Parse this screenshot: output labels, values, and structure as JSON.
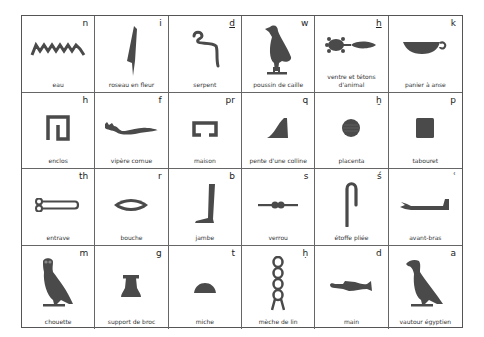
{
  "chart_title": "",
  "glyph_color": "#4a4a4a",
  "cells": [
    {
      "phoneme": "n",
      "underline": false,
      "label": "eau",
      "icon": "water-icon"
    },
    {
      "phoneme": "i",
      "underline": false,
      "label": "roseau en fleur",
      "icon": "reed-icon"
    },
    {
      "phoneme": "d",
      "underline": true,
      "label": "serpent",
      "icon": "cobra-icon"
    },
    {
      "phoneme": "w",
      "underline": false,
      "label": "poussin de caille",
      "icon": "quail-chick-icon"
    },
    {
      "phoneme": "h",
      "underline": true,
      "label": "ventre et tétons d'animal",
      "icon": "belly-icon"
    },
    {
      "phoneme": "k",
      "underline": false,
      "label": "panier à anse",
      "icon": "basket-icon"
    },
    {
      "phoneme": "h",
      "underline": false,
      "label": "enclos",
      "icon": "enclosure-icon"
    },
    {
      "phoneme": "f",
      "underline": false,
      "label": "vipère cornue",
      "icon": "horned-viper-icon"
    },
    {
      "phoneme": "pr",
      "underline": false,
      "label": "maison",
      "icon": "house-icon"
    },
    {
      "phoneme": "q",
      "underline": false,
      "label": "pente d'une colline",
      "icon": "hill-slope-icon"
    },
    {
      "phoneme": "ḫ",
      "underline": false,
      "label": "placenta",
      "icon": "placenta-icon"
    },
    {
      "phoneme": "p",
      "underline": false,
      "label": "tabouret",
      "icon": "stool-icon"
    },
    {
      "phoneme": "th",
      "underline": false,
      "label": "entrave",
      "icon": "tether-icon"
    },
    {
      "phoneme": "r",
      "underline": false,
      "label": "bouche",
      "icon": "mouth-icon"
    },
    {
      "phoneme": "b",
      "underline": false,
      "label": "jambe",
      "icon": "leg-icon"
    },
    {
      "phoneme": "s",
      "underline": false,
      "label": "verrou",
      "icon": "bolt-icon"
    },
    {
      "phoneme": "ś",
      "underline": false,
      "label": "étoffe pliée",
      "icon": "folded-cloth-icon"
    },
    {
      "phoneme": "ʿ",
      "underline": false,
      "label": "avant-bras",
      "icon": "forearm-icon"
    },
    {
      "phoneme": "m",
      "underline": false,
      "label": "chouette",
      "icon": "owl-icon"
    },
    {
      "phoneme": "g",
      "underline": false,
      "label": "support de broc",
      "icon": "jar-stand-icon"
    },
    {
      "phoneme": "t",
      "underline": false,
      "label": "miche",
      "icon": "bread-loaf-icon"
    },
    {
      "phoneme": "ḥ",
      "underline": false,
      "label": "mèche de lin",
      "icon": "flax-wick-icon"
    },
    {
      "phoneme": "d",
      "underline": false,
      "label": "main",
      "icon": "hand-icon"
    },
    {
      "phoneme": "a",
      "underline": false,
      "label": "vautour égyptien",
      "icon": "vulture-icon"
    }
  ]
}
